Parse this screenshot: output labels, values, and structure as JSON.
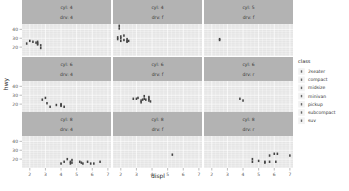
{
  "chart_data": {
    "type": "scatter",
    "title": "",
    "xlabel": "displ",
    "ylabel": "hwy",
    "facet": {
      "rows": "cyl",
      "cols": "drv",
      "wrap": true
    },
    "x_ticks": [
      2,
      3,
      4,
      5,
      6,
      7
    ],
    "y_ticks": [
      20,
      30,
      40
    ],
    "xlim": [
      1.5,
      7.2
    ],
    "ylim": [
      10,
      46
    ],
    "grid": true,
    "legend": {
      "title": "class",
      "position": "right",
      "entries": [
        "2seater",
        "compact",
        "midsize",
        "minivan",
        "pickup",
        "subcompact",
        "suv"
      ]
    },
    "panels": [
      {
        "strip": [
          "cyl: 4",
          "drv: 4"
        ],
        "points": [
          [
            1.8,
            24
          ],
          [
            2.0,
            27
          ],
          [
            2.2,
            26
          ],
          [
            2.4,
            25
          ],
          [
            2.5,
            24
          ],
          [
            2.5,
            23
          ],
          [
            2.7,
            22
          ],
          [
            2.7,
            19
          ],
          [
            2.5,
            26
          ]
        ]
      },
      {
        "strip": [
          "cyl: 4",
          "drv: f"
        ],
        "points": [
          [
            1.8,
            29
          ],
          [
            1.8,
            31
          ],
          [
            2.0,
            32
          ],
          [
            2.0,
            30
          ],
          [
            2.4,
            27
          ],
          [
            2.4,
            26
          ],
          [
            2.5,
            27
          ],
          [
            2.2,
            33
          ],
          [
            2.4,
            29
          ],
          [
            1.9,
            44
          ],
          [
            1.9,
            41
          ],
          [
            2.2,
            28
          ],
          [
            2.0,
            27
          ]
        ]
      },
      {
        "strip": [
          "cyl: 5",
          "drv: f"
        ],
        "points": [
          [
            2.5,
            29
          ],
          [
            2.5,
            28
          ]
        ]
      },
      {
        "strip": [
          "cyl: 6",
          "drv: 4"
        ],
        "points": [
          [
            2.8,
            25
          ],
          [
            3.0,
            27
          ],
          [
            3.1,
            21
          ],
          [
            4.0,
            19
          ],
          [
            4.0,
            18
          ],
          [
            3.3,
            17
          ],
          [
            4.0,
            20
          ],
          [
            3.7,
            19
          ],
          [
            4.2,
            17
          ]
        ]
      },
      {
        "strip": [
          "cyl: 6",
          "drv: f"
        ],
        "points": [
          [
            2.8,
            26
          ],
          [
            3.0,
            26
          ],
          [
            3.1,
            27
          ],
          [
            3.3,
            24
          ],
          [
            3.5,
            26
          ],
          [
            3.6,
            25
          ],
          [
            3.8,
            26
          ],
          [
            3.8,
            24
          ],
          [
            3.9,
            23
          ],
          [
            3.8,
            28
          ],
          [
            3.5,
            29
          ],
          [
            3.3,
            22
          ],
          [
            3.4,
            25
          ]
        ]
      },
      {
        "strip": [
          "cyl: 6",
          "drv: r"
        ],
        "points": [
          [
            3.8,
            26
          ],
          [
            4.0,
            24
          ]
        ]
      },
      {
        "strip": [
          "cyl: 8",
          "drv: 4"
        ],
        "points": [
          [
            4.0,
            15
          ],
          [
            4.2,
            17
          ],
          [
            4.6,
            17
          ],
          [
            4.7,
            16
          ],
          [
            4.7,
            19
          ],
          [
            5.2,
            17
          ],
          [
            5.3,
            16
          ],
          [
            5.7,
            17
          ],
          [
            5.9,
            15
          ],
          [
            6.1,
            15
          ],
          [
            6.5,
            17
          ],
          [
            5.4,
            15
          ],
          [
            4.4,
            20
          ],
          [
            4.6,
            15
          ]
        ]
      },
      {
        "strip": [
          "cyl: 8",
          "drv: f"
        ],
        "points": [
          [
            5.3,
            25
          ]
        ]
      },
      {
        "strip": [
          "cyl: 8",
          "drv: r"
        ],
        "points": [
          [
            4.6,
            20
          ],
          [
            4.6,
            17
          ],
          [
            5.0,
            18
          ],
          [
            5.4,
            17
          ],
          [
            5.7,
            24
          ],
          [
            6.0,
            26
          ],
          [
            6.2,
            26
          ],
          [
            7.0,
            24
          ],
          [
            5.4,
            16
          ],
          [
            5.7,
            17
          ],
          [
            6.1,
            17
          ]
        ]
      }
    ]
  },
  "axes": {
    "x_label": "displ",
    "y_label": "hwy"
  },
  "legend": {
    "title": "class",
    "items": [
      "2seater",
      "compact",
      "midsize",
      "minivan",
      "pickup",
      "subcompact",
      "suv"
    ]
  }
}
